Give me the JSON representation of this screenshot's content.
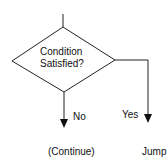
{
  "diagram": {
    "type": "flowchart-decision",
    "decision": {
      "line1": "Condition",
      "line2": "Satisfied?"
    },
    "branches": {
      "no": {
        "label": "No",
        "target": "(Continue)"
      },
      "yes": {
        "label": "Yes",
        "target": "Jump"
      }
    },
    "colors": {
      "stroke": "#222222",
      "text": "#111111",
      "background": "#ffffff"
    }
  }
}
